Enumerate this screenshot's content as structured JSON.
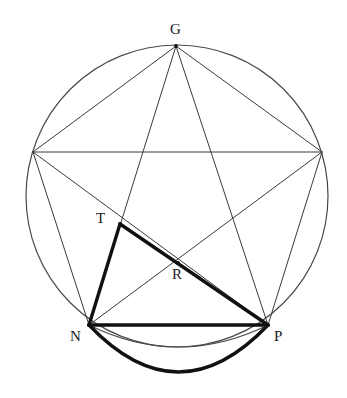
{
  "figure": {
    "kind": "geometric-diagram",
    "canvas": {
      "width": 347,
      "height": 398,
      "background": "#ffffff"
    },
    "stroke": {
      "thin_color": "#3a3a3a",
      "thin_width": 1,
      "thick_color": "#111111",
      "thick_width": 3.4,
      "circle_color": "#4a4a4a",
      "circle_width": 1.2
    },
    "circle": {
      "cx": 177,
      "cy": 196,
      "r": 151
    },
    "points": {
      "G": {
        "x": 176,
        "y": 46,
        "label": "G",
        "label_x": 170,
        "label_y": 22
      },
      "E": {
        "x": 322,
        "y": 152,
        "label": "",
        "label_x": 0,
        "label_y": 0
      },
      "P": {
        "x": 268,
        "y": 325,
        "label": "P",
        "label_x": 274,
        "label_y": 329
      },
      "N": {
        "x": 89,
        "y": 325,
        "label": "N",
        "label_x": 70,
        "label_y": 329
      },
      "L": {
        "x": 33,
        "y": 152,
        "label": "",
        "label_x": 0,
        "label_y": 0
      },
      "T": {
        "x": 120,
        "y": 224,
        "label": "T",
        "label_x": 96,
        "label_y": 211
      },
      "R": {
        "x": 178,
        "y": 263,
        "label": "R",
        "label_x": 172,
        "label_y": 267
      }
    },
    "thin_segments": [
      {
        "from": "G",
        "to": "E",
        "name": "pentagon-side-g-e"
      },
      {
        "from": "E",
        "to": "P",
        "name": "pentagon-side-e-p"
      },
      {
        "from": "P",
        "to": "N",
        "name": "pentagon-side-p-n"
      },
      {
        "from": "N",
        "to": "L",
        "name": "pentagon-side-n-l"
      },
      {
        "from": "L",
        "to": "G",
        "name": "pentagon-side-l-g"
      },
      {
        "from": "G",
        "to": "P",
        "name": "diagonal-g-p"
      },
      {
        "from": "G",
        "to": "N",
        "name": "diagonal-g-n"
      },
      {
        "from": "E",
        "to": "N",
        "name": "diagonal-e-n"
      },
      {
        "from": "E",
        "to": "L",
        "name": "diagonal-e-l"
      },
      {
        "from": "P",
        "to": "L",
        "name": "diagonal-p-l"
      }
    ],
    "thick_segments": [
      {
        "from": "T",
        "to": "N",
        "name": "heavy-edge-t-n"
      },
      {
        "from": "T",
        "to": "P",
        "name": "heavy-edge-t-p"
      },
      {
        "from": "N",
        "to": "P",
        "name": "heavy-edge-n-p"
      }
    ],
    "thin_arc": {
      "from": "N",
      "to": "P",
      "sagitta_y": 347,
      "name": "thin-lower-arc-n-p"
    },
    "thick_arc": {
      "from": "N",
      "to": "P",
      "sagitta_y": 372,
      "name": "heavy-lower-arc-n-p"
    },
    "vertex_labels": [
      {
        "key": "G",
        "text": "G",
        "x": 170,
        "y": 22
      },
      {
        "key": "T",
        "text": "T",
        "x": 96,
        "y": 211
      },
      {
        "key": "R",
        "text": "R",
        "x": 172,
        "y": 267
      },
      {
        "key": "N",
        "text": "N",
        "x": 70,
        "y": 329
      },
      {
        "key": "P",
        "text": "P",
        "x": 274,
        "y": 329
      }
    ]
  }
}
